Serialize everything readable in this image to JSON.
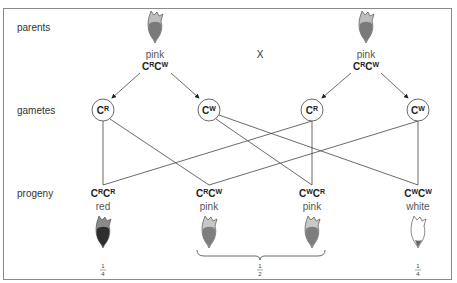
{
  "rows": {
    "parents": "parents",
    "gametes": "gametes",
    "progeny": "progeny"
  },
  "cross_symbol": "X",
  "parents": [
    {
      "phenotype": "pink",
      "genotype": {
        "a": "C",
        "a_sup": "R",
        "b": "C",
        "b_sup": "W"
      }
    },
    {
      "phenotype": "pink",
      "genotype": {
        "a": "C",
        "a_sup": "R",
        "b": "C",
        "b_sup": "W"
      }
    }
  ],
  "gametes": [
    {
      "base": "C",
      "sup": "R"
    },
    {
      "base": "C",
      "sup": "W"
    },
    {
      "base": "C",
      "sup": "R"
    },
    {
      "base": "C",
      "sup": "W"
    }
  ],
  "progeny": [
    {
      "genotype": {
        "a": "C",
        "a_sup": "R",
        "b": "C",
        "b_sup": "R"
      },
      "phenotype": "red",
      "fraction": {
        "num": "1",
        "den": "4"
      }
    },
    {
      "genotype": {
        "a": "C",
        "a_sup": "R",
        "b": "C",
        "b_sup": "W"
      },
      "phenotype": "pink"
    },
    {
      "genotype": {
        "a": "C",
        "a_sup": "W",
        "b": "C",
        "b_sup": "R"
      },
      "phenotype": "pink"
    },
    {
      "genotype": {
        "a": "C",
        "a_sup": "W",
        "b": "C",
        "b_sup": "W"
      },
      "phenotype": "white",
      "fraction": {
        "num": "1",
        "den": "4"
      }
    }
  ],
  "pink_fraction": {
    "num": "1",
    "den": "2"
  },
  "colors": {
    "red_flower": "#3a3a3a",
    "pink_flower": "#8c8c8c",
    "white_flower": "#ffffff",
    "outline": "#555555",
    "border": "#8a8a8a"
  }
}
